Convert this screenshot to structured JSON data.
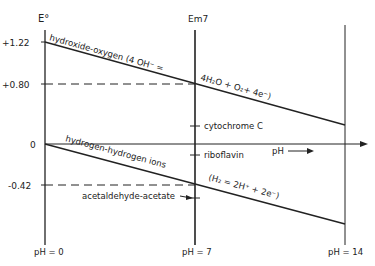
{
  "axes": {
    "left_title": "E°",
    "mid_title": "Em7",
    "y_ticks": [
      "+1.22",
      "+0.80",
      "0",
      "-0.42"
    ],
    "ph_labels": [
      "pH = 0",
      "pH = 7",
      "pH = 14"
    ],
    "ph_arrow_label": "pH"
  },
  "lines": {
    "oxygen_label": "hydroxide-oxygen (4 OH⁻ =",
    "oxygen_eq": "4H₂O + O₂+ 4e⁻)",
    "hydrogen_label": "hydrogen-hydrogen ions",
    "hydrogen_eq": "(H₂ = 2H⁺ + 2e⁻)"
  },
  "markers": {
    "cytochrome": "cytochrome C",
    "riboflavin": "riboflavin",
    "acetaldehyde": "acetaldehyde-acetate"
  }
}
